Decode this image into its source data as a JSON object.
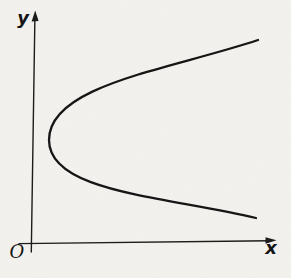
{
  "figure": {
    "kind": "math-plot",
    "background_color": "#f3f2ee",
    "ink_color": "#1c1c1c",
    "labels": {
      "y_axis": "y",
      "x_axis": "x",
      "origin": "O"
    },
    "axes": {
      "x_axis_path": "M 19 243.6 L 269.5 240.8",
      "x_arrow_points": "276.5,240.3 265.5,237.3 265.5,243.7",
      "y_axis_path": "M 34.9 17 L 31.3 252",
      "y_arrow_points": "35.2,10.5 31.6,21.6 38.6,21.0",
      "ticks": "none",
      "grid": false
    },
    "curve": {
      "shape": "parabola",
      "opens": "right",
      "path": "M 258 40 C 168 70 49 85 49 140 C 49 192 162 196 256 218",
      "vertex_px": {
        "x": 49,
        "y": 140
      },
      "upper_end_px": {
        "x": 258,
        "y": 40
      },
      "lower_end_px": {
        "x": 256,
        "y": 218
      },
      "sample_points_px": [
        [
          258,
          40
        ],
        [
          145,
          72
        ],
        [
          76,
          101
        ],
        [
          49,
          140
        ],
        [
          62,
          170
        ],
        [
          145,
          195
        ],
        [
          256,
          218
        ]
      ]
    }
  }
}
